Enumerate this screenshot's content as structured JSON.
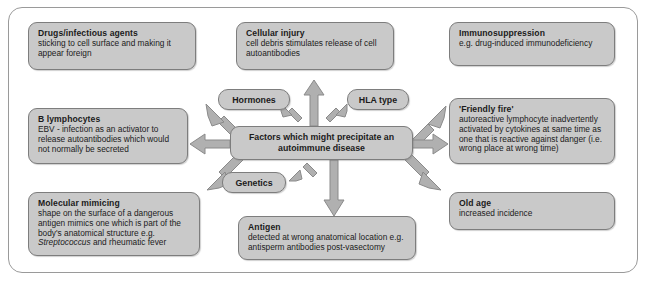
{
  "diagram": {
    "center": {
      "label": "Factors which might precipitate an autoimmune disease"
    },
    "pills": [
      {
        "id": "hormones",
        "label": "Hormones"
      },
      {
        "id": "hla-type",
        "label": "HLA type"
      },
      {
        "id": "genetics",
        "label": "Genetics"
      }
    ],
    "boxes": [
      {
        "id": "drugs-infectious-agents",
        "title": "Drugs/infectious agents",
        "body": "sticking to cell surface and making it appear foreign"
      },
      {
        "id": "cellular-injury",
        "title": "Cellular injury",
        "body": "cell debris stimulates release of cell autoantibodies"
      },
      {
        "id": "immunosuppression",
        "title": "Immunosuppression",
        "body": "e.g. drug-induced immunodeficiency"
      },
      {
        "id": "b-lymphocytes",
        "title": "B lymphocytes",
        "body": "EBV - infection as an activator to release autoantibodies which would not normally be secreted"
      },
      {
        "id": "friendly-fire",
        "title": "'Friendly fire'",
        "body": "autoreactive lymphocyte inadvertently activated by cytokines at same time as one that is reactive against danger (i.e. wrong place at wrong time)"
      },
      {
        "id": "molecular-mimicing",
        "title": "Molecular mimicing",
        "body_pre": "shape on the surface of a dangerous antigen mimics one which is part of the body's anatomical structure e.g. ",
        "body_italic": "Streptococcus",
        "body_post": " and rheumatic fever"
      },
      {
        "id": "old-age",
        "title": "Old age",
        "body": "increased incidence"
      },
      {
        "id": "antigen",
        "title": "Antigen",
        "body": "detected at wrong anatomical location e.g. antisperm antibodies post-vasectomy"
      }
    ],
    "colors": {
      "box_fill": "#c9c9c9",
      "box_border": "#7d7d7d",
      "arrow_fill": "#b0b0b0",
      "arrow_border": "#8a8a8a",
      "frame_border": "#9a9a9a",
      "text": "#1b1b1b",
      "background": "#ffffff"
    },
    "arrows": [
      {
        "id": "arrow-to-drugs",
        "direction": "up-left",
        "target": "drugs-infectious-agents"
      },
      {
        "id": "arrow-to-cellular-injury",
        "direction": "up",
        "target": "cellular-injury"
      },
      {
        "id": "arrow-to-immunosuppression",
        "direction": "up-right",
        "target": "immunosuppression"
      },
      {
        "id": "arrow-to-hormones",
        "direction": "up-left",
        "target": "hormones"
      },
      {
        "id": "arrow-to-hla-type",
        "direction": "up-right",
        "target": "hla-type"
      },
      {
        "id": "arrow-to-b-lymphocytes",
        "direction": "left",
        "target": "b-lymphocytes"
      },
      {
        "id": "arrow-to-friendly-fire",
        "direction": "right",
        "target": "friendly-fire"
      },
      {
        "id": "arrow-to-molecular-mimicing",
        "direction": "down-left",
        "target": "molecular-mimicing"
      },
      {
        "id": "arrow-to-genetics",
        "direction": "down-left",
        "target": "genetics"
      },
      {
        "id": "arrow-to-antigen",
        "direction": "down",
        "target": "antigen"
      },
      {
        "id": "arrow-to-old-age",
        "direction": "down-right",
        "target": "old-age"
      }
    ]
  }
}
